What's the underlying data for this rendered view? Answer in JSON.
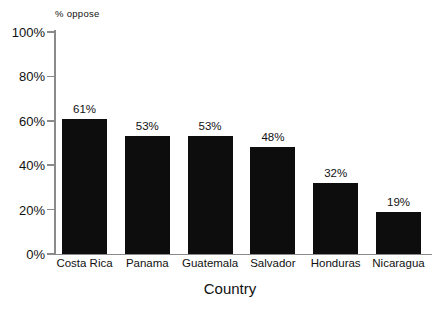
{
  "chart_data": {
    "type": "bar",
    "title": "",
    "subtitle": "",
    "xlabel": "Country",
    "ylabel": "% oppose",
    "categories": [
      "Costa Rica",
      "Panama",
      "Guatemala",
      "Salvador",
      "Honduras",
      "Nicaragua"
    ],
    "values": [
      61,
      53,
      53,
      48,
      32,
      19
    ],
    "value_labels": [
      "61%",
      "53%",
      "53%",
      "48%",
      "32%",
      "19%"
    ],
    "ylim": [
      0,
      100
    ],
    "ytick_values": [
      100,
      80,
      60,
      40,
      20,
      0
    ],
    "ytick_labels": [
      "100%",
      "80%",
      "60%",
      "40%",
      "20%",
      "0%"
    ],
    "grid": false,
    "legend": null,
    "legend_position": "none",
    "series": [
      {
        "name": "% oppose",
        "values": [
          61,
          53,
          53,
          48,
          32,
          19
        ]
      }
    ],
    "colors": {
      "bar_fill": "#0d0d0d",
      "axis": "#8a8a8a",
      "text": "#111111",
      "background": "#ffffff"
    }
  }
}
